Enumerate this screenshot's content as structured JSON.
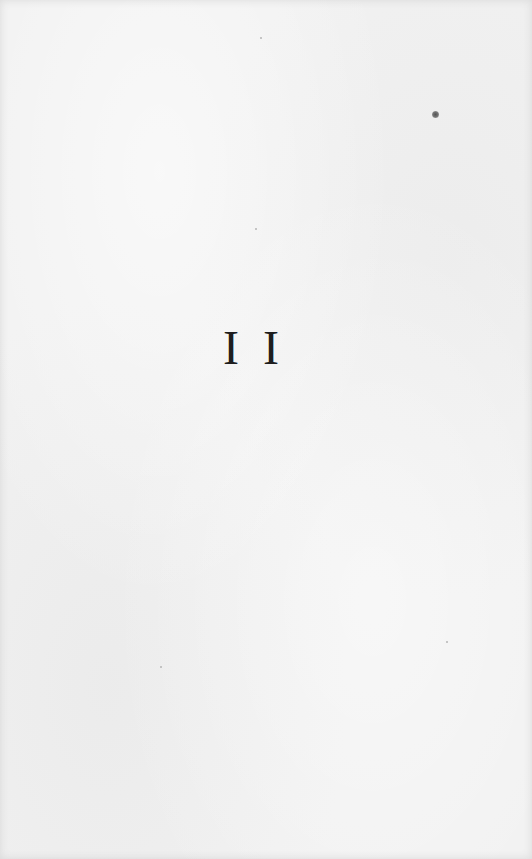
{
  "page": {
    "type": "book-page",
    "background_color": "#f1f1f1",
    "numeral": "I I",
    "text_color": "#1e1e1e"
  }
}
